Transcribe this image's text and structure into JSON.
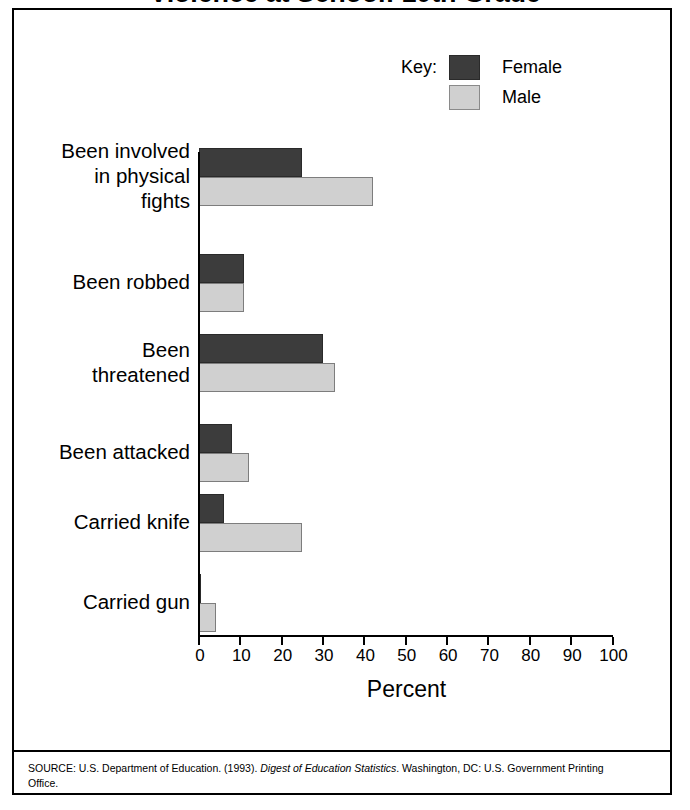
{
  "figure": {
    "title": "Violence at School: 10th Grade",
    "axis_title": "Percent",
    "source_prefix": "SOURCE: U.S. Department of Education. (1993). ",
    "source_italic": "Digest of Education Statistics",
    "source_suffix": ". Washington, DC: U.S. Government Printing Office."
  },
  "legend": {
    "key_label": "Key:",
    "entries": [
      {
        "label": "Female",
        "color": "#3c3c3c"
      },
      {
        "label": "Male",
        "color": "#d0d0d0"
      }
    ]
  },
  "axis": {
    "ticks": [
      "0",
      "10",
      "20",
      "30",
      "40",
      "50",
      "60",
      "70",
      "80",
      "90",
      "100"
    ]
  },
  "chart_data": {
    "type": "bar",
    "orientation": "horizontal",
    "title": "Violence at School: 10th Grade",
    "xlabel": "Percent",
    "ylabel": "",
    "xlim": [
      0,
      100
    ],
    "grid": false,
    "legend_position": "top-right",
    "categories": [
      "Been involved\nin physical\nfights",
      "Been robbed",
      "Been\nthreatened",
      "Been attacked",
      "Carried knife",
      "Carried gun"
    ],
    "series": [
      {
        "name": "Female",
        "color": "#3c3c3c",
        "values": [
          25,
          11,
          30,
          8,
          6,
          0.5
        ]
      },
      {
        "name": "Male",
        "color": "#d0d0d0",
        "values": [
          42,
          11,
          33,
          12,
          25,
          4
        ]
      }
    ]
  }
}
